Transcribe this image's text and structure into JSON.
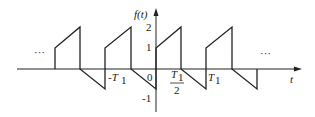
{
  "diagram": {
    "y_axis_label": "f(t)",
    "x_axis_label": "t",
    "y_ticks": [
      {
        "label": "2",
        "value": 2
      },
      {
        "label": "1",
        "value": 1
      },
      {
        "label": "-1",
        "value": -1
      }
    ],
    "x_ticks": [
      {
        "label": "-T",
        "sub": "1",
        "position": "-T1"
      },
      {
        "label": "0",
        "position": "0"
      },
      {
        "label": "T",
        "sub": "1",
        "denominator": "2",
        "position": "T1/2"
      },
      {
        "label": "T",
        "sub": "1",
        "position": "T1"
      }
    ],
    "ellipsis_left": "···",
    "ellipsis_right": "···",
    "colors": {
      "line": "#222222",
      "background": "#ffffff"
    },
    "waveform_description": "Periodic with period T1: at start of each period jumps to 1, rises linearly to 2 over half period, drops to 0, falls linearly to -1 over next half period, then jumps back to 1."
  }
}
